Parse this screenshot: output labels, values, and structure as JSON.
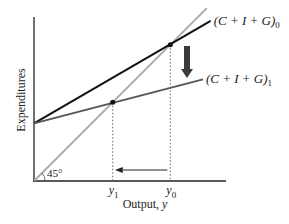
{
  "chart_data": {
    "type": "line",
    "title": "",
    "xlabel": "Output, y",
    "ylabel": "Expenditures",
    "angle_label": "45°",
    "x_ticks": [
      {
        "base": "y",
        "sub": "1",
        "x": 0.41
      },
      {
        "base": "y",
        "sub": "0",
        "x": 0.71
      }
    ],
    "xlim": [
      0,
      1
    ],
    "ylim": [
      0,
      1
    ],
    "series": [
      {
        "name": "45-degree line",
        "intercept": 0.0,
        "slope": 1.0,
        "x_end": 0.9,
        "color": "#a9a9a9"
      },
      {
        "name": "(C + I + G)0",
        "label_base": "(C + I + G)",
        "label_sub": "0",
        "intercept": 0.3,
        "slope": 0.58,
        "x_end": 0.92,
        "color": "#111111"
      },
      {
        "name": "(C + I + G)1",
        "label_base": "(C + I + G)",
        "label_sub": "1",
        "intercept": 0.3,
        "slope": 0.26,
        "x_end": 0.88,
        "color": "#555555"
      }
    ],
    "equilibria": [
      {
        "name": "y0",
        "x": 0.71,
        "y": 0.71
      },
      {
        "name": "y1",
        "x": 0.41,
        "y": 0.41
      }
    ],
    "annotations": [
      {
        "type": "shift-arrow",
        "description": "downward shift of aggregate expenditure",
        "color": "#444444"
      },
      {
        "type": "output-arrow",
        "description": "output falls from y0 to y1"
      }
    ]
  }
}
